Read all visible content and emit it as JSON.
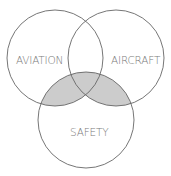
{
  "diagram": {
    "type": "venn",
    "sets": [
      {
        "label": "AVIATION",
        "cx": 55,
        "cy": 58,
        "r": 48
      },
      {
        "label": "AIRCRAFT",
        "cx": 116,
        "cy": 58,
        "r": 48
      },
      {
        "label": "SAFETY",
        "cx": 86,
        "cy": 120,
        "r": 48
      }
    ],
    "highlighted_region": "SAFETY ∩ (AVIATION ∪ AIRCRAFT)",
    "colors": {
      "stroke": "#666666",
      "fill_highlight": "#cccccc",
      "label": "#7a7a7a"
    }
  }
}
